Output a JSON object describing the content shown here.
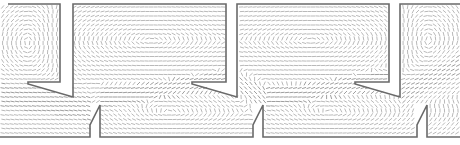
{
  "figure": {
    "type": "cfd-velocity-vector-field",
    "width": 460,
    "height": 145,
    "colors": {
      "background": "#ffffff",
      "wall": "#6a6a6a",
      "vector": "#8a8a8a",
      "vector_dense": "#5c5c5c"
    },
    "period_px": 163,
    "geometry": {
      "top_walls": [
        "M8,4 L60,4 L60,82 L28,82 L28,84 L73,97 L73,4 L226,4 L226,82 L192,82 L192,84 L237,97 L237,4 L389,4 L389,82 L355,82 L355,84 L400,97 L400,4 L460,4"
      ],
      "bottom_walls": [
        "M0,137 L90,137 L90,125 L100,105 L100,137 L253,137 L253,125 L263,105 L263,137 L417,137 L417,125 L427,105 L427,137 L460,137"
      ]
    },
    "vortices": [
      {
        "cx": 30,
        "cy": 42,
        "rx": 26,
        "ry": 30,
        "dir": -1
      },
      {
        "cx": 150,
        "cy": 40,
        "rx": 70,
        "ry": 28,
        "dir": 1
      },
      {
        "cx": 170,
        "cy": 112,
        "rx": 60,
        "ry": 20,
        "dir": -1
      },
      {
        "cx": 312,
        "cy": 40,
        "rx": 70,
        "ry": 28,
        "dir": 1
      },
      {
        "cx": 330,
        "cy": 112,
        "rx": 60,
        "ry": 20,
        "dir": -1
      },
      {
        "cx": 425,
        "cy": 40,
        "rx": 25,
        "ry": 28,
        "dir": -1
      }
    ],
    "jets": [
      {
        "x0": 0,
        "y0": 95,
        "x1": 90,
        "y1": 108,
        "thickness": 18
      },
      {
        "x0": 100,
        "y0": 98,
        "x1": 235,
        "y1": 80,
        "thickness": 14
      },
      {
        "x0": 235,
        "y0": 80,
        "x1": 265,
        "y1": 98,
        "thickness": 14
      },
      {
        "x0": 265,
        "y0": 98,
        "x1": 400,
        "y1": 80,
        "thickness": 14
      },
      {
        "x0": 400,
        "y0": 95,
        "x1": 460,
        "y1": 65,
        "thickness": 14
      }
    ]
  }
}
